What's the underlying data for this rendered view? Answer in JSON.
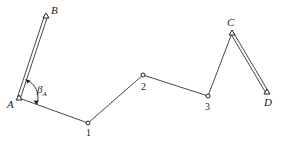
{
  "diagram": {
    "type": "traverse-survey",
    "known_points": [
      {
        "id": "B",
        "label": "B",
        "x": 46,
        "y": 16,
        "lx": 51,
        "ly": 14
      },
      {
        "id": "A",
        "label": "A",
        "x": 19,
        "y": 98,
        "lx": 7,
        "ly": 108
      },
      {
        "id": "C",
        "label": "C",
        "x": 232,
        "y": 33,
        "lx": 227,
        "ly": 26
      },
      {
        "id": "D",
        "label": "D",
        "x": 267,
        "y": 92,
        "lx": 264,
        "ly": 106
      }
    ],
    "traverse_points": [
      {
        "id": "1",
        "label": "1",
        "x": 88,
        "y": 123,
        "lx": 86,
        "ly": 136
      },
      {
        "id": "2",
        "label": "2",
        "x": 143,
        "y": 75,
        "lx": 141,
        "ly": 90
      },
      {
        "id": "3",
        "label": "3",
        "x": 208,
        "y": 96,
        "lx": 205,
        "ly": 110
      }
    ],
    "known_edges": [
      [
        "A",
        "B"
      ],
      [
        "C",
        "D"
      ]
    ],
    "traverse_path": [
      "A",
      "1",
      "2",
      "3",
      "C"
    ],
    "angle": {
      "label": "β",
      "subscript": "A",
      "at": "A",
      "from": "B",
      "to": "1"
    }
  }
}
